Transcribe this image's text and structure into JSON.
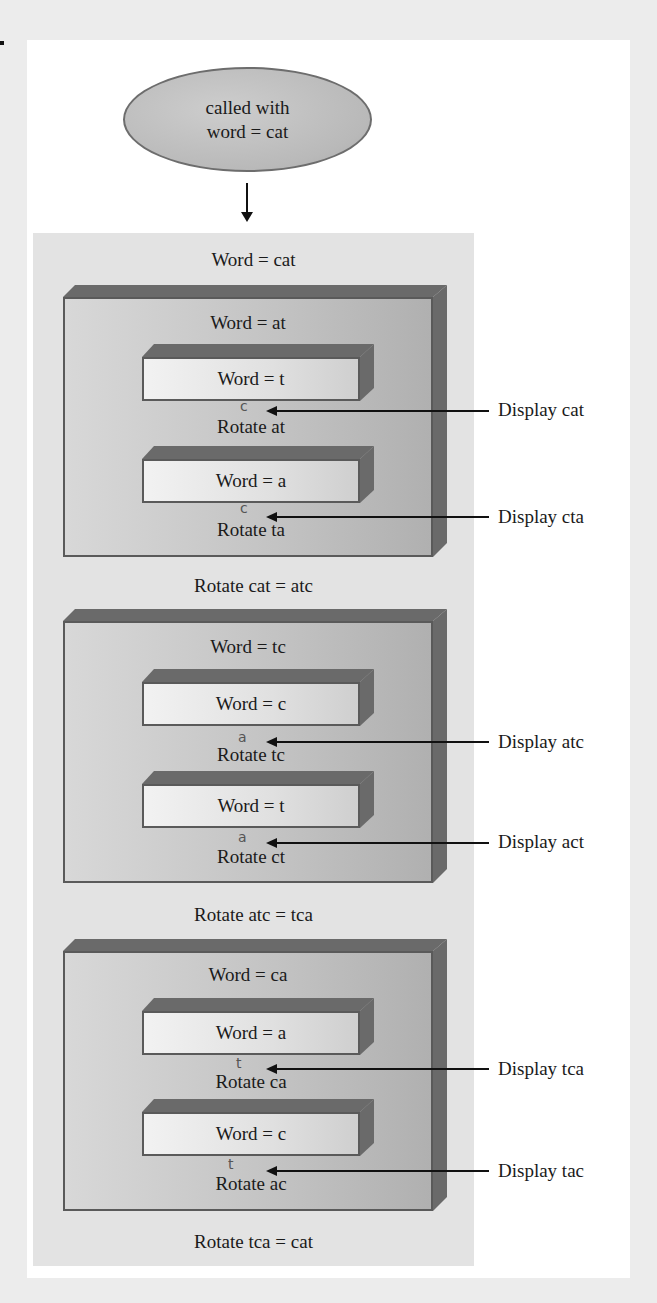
{
  "start": {
    "line1": "called with",
    "line2": "word = cat"
  },
  "top_label": "Word = cat",
  "levels": [
    {
      "word": "Word = at",
      "inner": [
        {
          "word": "Word = t",
          "rotate": "Rotate at",
          "display": "Display cat",
          "mark": "c"
        },
        {
          "word": "Word = a",
          "rotate": "Rotate ta",
          "display": "Display cta",
          "mark": "c"
        }
      ],
      "result": "Rotate cat = atc"
    },
    {
      "word": "Word = tc",
      "inner": [
        {
          "word": "Word = c",
          "rotate": "Rotate tc",
          "display": "Display atc",
          "mark": "a"
        },
        {
          "word": "Word = t",
          "rotate": "Rotate ct",
          "display": "Display act",
          "mark": "a"
        }
      ],
      "result": "Rotate atc = tca"
    },
    {
      "word": "Word = ca",
      "inner": [
        {
          "word": "Word = a",
          "rotate": "Rotate ca",
          "display": "Display tca",
          "mark": "t"
        },
        {
          "word": "Word = c",
          "rotate": "Rotate ac",
          "display": "Display tac",
          "mark": "t"
        }
      ],
      "result": "Rotate tca = cat"
    }
  ],
  "colors": {
    "bevel": "#6a6a6a",
    "panel": "#e3e3e3",
    "oval": "#bfbfbf"
  }
}
